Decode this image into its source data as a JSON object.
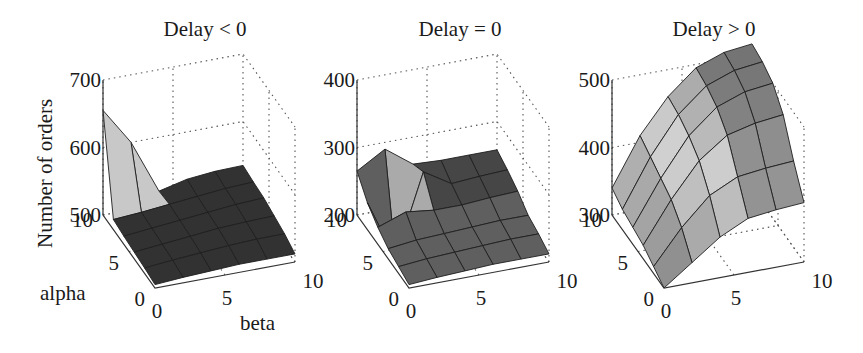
{
  "figure": {
    "ylabel": "Number of orders",
    "alpha_label": "alpha",
    "beta_label": "beta"
  },
  "chart_data": [
    {
      "type": "surface",
      "title": "Delay < 0",
      "xlabel": "beta",
      "ylabel": "alpha",
      "zlabel": "Number of orders",
      "zlim": [
        500,
        700
      ],
      "z_ticks": [
        "500",
        "600",
        "700"
      ],
      "alpha_ticks": [
        "0",
        "5",
        "10"
      ],
      "beta_ticks": [
        "0",
        "5",
        "10"
      ],
      "grid": true,
      "alpha": [
        0,
        2,
        4,
        6,
        8,
        10
      ],
      "beta": [
        0,
        2,
        4,
        6,
        8,
        10
      ],
      "z": [
        [
          505,
          508,
          510,
          512,
          512,
          512
        ],
        [
          508,
          512,
          515,
          518,
          520,
          520
        ],
        [
          510,
          514,
          518,
          522,
          524,
          525
        ],
        [
          512,
          516,
          520,
          524,
          528,
          530
        ],
        [
          515,
          518,
          522,
          526,
          530,
          532
        ],
        [
          655,
          600,
          520,
          530,
          534,
          535
        ]
      ]
    },
    {
      "type": "surface",
      "title": "Delay = 0",
      "xlabel": "beta",
      "ylabel": "alpha",
      "zlabel": "Number of orders",
      "zlim": [
        200,
        400
      ],
      "z_ticks": [
        "200",
        "300",
        "400"
      ],
      "alpha_ticks": [
        "0",
        "5",
        "10"
      ],
      "beta_ticks": [
        "0",
        "5",
        "10"
      ],
      "grid": true,
      "alpha": [
        0,
        2,
        4,
        6,
        8,
        10
      ],
      "beta": [
        0,
        2,
        4,
        6,
        8,
        10
      ],
      "z": [
        [
          205,
          208,
          210,
          212,
          212,
          212
        ],
        [
          210,
          214,
          216,
          218,
          220,
          220
        ],
        [
          215,
          220,
          222,
          224,
          226,
          226
        ],
        [
          225,
          240,
          235,
          235,
          238,
          240
        ],
        [
          240,
          150,
          270,
          245,
          248,
          250
        ],
        [
          265,
          290,
          260,
          258,
          258,
          258
        ]
      ]
    },
    {
      "type": "surface",
      "title": "Delay > 0",
      "xlabel": "beta",
      "ylabel": "alpha",
      "zlabel": "Number of orders",
      "zlim": [
        300,
        500
      ],
      "z_ticks": [
        "300",
        "400",
        "500"
      ],
      "alpha_ticks": [
        "0",
        "5",
        "10"
      ],
      "beta_ticks": [
        "0",
        "5",
        "10"
      ],
      "grid": true,
      "alpha": [
        0,
        2,
        4,
        6,
        8,
        10
      ],
      "beta": [
        0,
        2,
        4,
        6,
        8,
        10
      ],
      "z": [
        [
          300,
          330,
          360,
          380,
          385,
          388
        ],
        [
          310,
          360,
          400,
          420,
          425,
          428
        ],
        [
          320,
          380,
          430,
          460,
          470,
          475
        ],
        [
          325,
          390,
          445,
          480,
          495,
          500
        ],
        [
          330,
          400,
          455,
          490,
          505,
          510
        ],
        [
          340,
          410,
          460,
          495,
          510,
          515
        ]
      ]
    }
  ]
}
